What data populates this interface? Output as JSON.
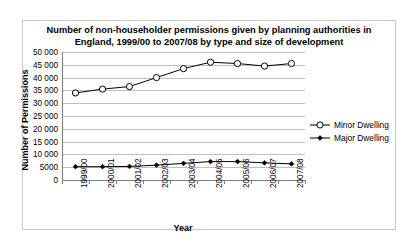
{
  "chart_data": {
    "type": "line",
    "title": "Number of non-householder permissions given by planning authorities in England, 1999/00 to 2007/08 by type and size of development",
    "title_line1": "Number of non-householder permissions given by planning authorities in",
    "title_line2": "England, 1999/00 to 2007/08 by type and size of development",
    "xlabel": "Year",
    "ylabel": "Number of Permissions",
    "categories": [
      "1999/00",
      "2000/01",
      "2001/02",
      "2002/03",
      "2003/04",
      "2004/05",
      "2005/06",
      "2006/07",
      "2007/08"
    ],
    "series": [
      {
        "name": "Minor Dwelling",
        "marker": "open-circle",
        "color": "#000000",
        "values": [
          34000,
          35500,
          36500,
          40000,
          43500,
          46000,
          45500,
          44500,
          45500
        ]
      },
      {
        "name": "Major Dwelling",
        "marker": "filled-diamond",
        "color": "#000000",
        "values": [
          5200,
          5200,
          5300,
          5800,
          6500,
          7200,
          7200,
          6700,
          6300
        ]
      }
    ],
    "ylim": [
      0,
      50000
    ],
    "ytick_values": [
      0,
      5000,
      10000,
      15000,
      20000,
      25000,
      30000,
      35000,
      40000,
      45000,
      50000
    ],
    "ytick_labels": [
      "0",
      "5000",
      "10 000",
      "15 000",
      "20 000",
      "25 000",
      "30 000",
      "35 000",
      "40 000",
      "45 000",
      "50 000"
    ],
    "grid": true,
    "legend_position": "right"
  }
}
